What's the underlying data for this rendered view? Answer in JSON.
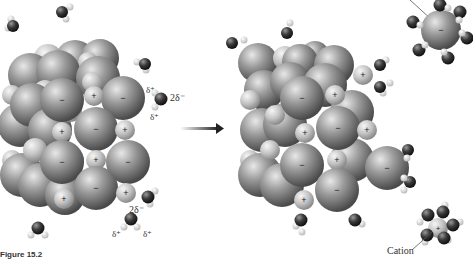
{
  "figure": {
    "caption": "Figure 15.2",
    "arrow": "right-arrow",
    "labels": {
      "partial_pos_1": "δ⁺",
      "partial_pos_2": "δ⁺",
      "partial_neg_1": "2δ⁻",
      "partial_neg_2": "2δ⁻",
      "partial_pos_3": "δ⁺",
      "partial_pos_4": "δ⁺",
      "cation": "Cation"
    },
    "ion_symbols": {
      "anion": "−",
      "cation": "+"
    },
    "colors": {
      "anion": "#7a7a7a",
      "cation": "#bdbdbd",
      "oxygen": "#3a3a3a",
      "hydrogen": "#e6e6e6",
      "background": "#ffffff"
    }
  }
}
